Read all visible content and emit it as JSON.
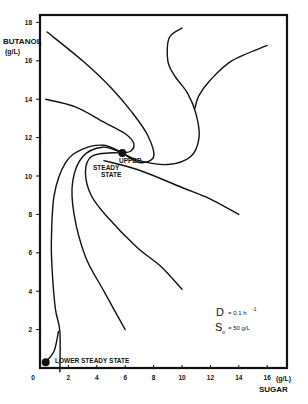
{
  "chart_data": {
    "type": "line",
    "title": "",
    "xlabel": "SUGAR",
    "xunit": "(g/L)",
    "ylabel": "BUTANOL",
    "yunit": "(g/L)",
    "xlim": [
      0,
      17.4
    ],
    "ylim": [
      0,
      18.4
    ],
    "xticks": [
      "0",
      "2",
      "4",
      "6",
      "8",
      "10",
      "12",
      "14",
      "16"
    ],
    "yticks": [
      "2",
      "4",
      "6",
      "8",
      "10",
      "12",
      "14",
      "16",
      "18"
    ],
    "grid": false,
    "annotations": {
      "upper_steady_state_line1": "UPPER",
      "upper_steady_state_line2": "STEADY",
      "upper_steady_state_line3": "STATE",
      "lower_steady_state": "LOWER STEADY STATE",
      "param_D": "D = 0.1 h",
      "param_D_exp": "-1",
      "param_S": "S",
      "param_S_sub": "o",
      "param_S_val": "= 50 g/L"
    },
    "steady_states": [
      {
        "name": "upper",
        "sugar": 5.8,
        "butanol": 11.2
      },
      {
        "name": "lower",
        "sugar": 0.4,
        "butanol": 0.3
      }
    ],
    "series": [
      {
        "name": "trajectory-1",
        "points": [
          [
            0.5,
            17.5
          ],
          [
            3.0,
            16.0
          ],
          [
            5.0,
            14.6
          ],
          [
            6.5,
            13.3
          ],
          [
            7.6,
            12.1
          ],
          [
            8.0,
            11.0
          ],
          [
            7.0,
            10.7
          ],
          [
            5.8,
            11.2
          ]
        ]
      },
      {
        "name": "trajectory-2",
        "points": [
          [
            0.4,
            14.0
          ],
          [
            2.5,
            13.6
          ],
          [
            4.5,
            12.8
          ],
          [
            6.0,
            12.2
          ],
          [
            6.6,
            11.7
          ],
          [
            6.4,
            11.3
          ],
          [
            5.8,
            11.2
          ]
        ]
      },
      {
        "name": "trajectory-3",
        "points": [
          [
            10.0,
            17.7
          ],
          [
            9.1,
            17.2
          ],
          [
            9.0,
            16.0
          ],
          [
            9.5,
            15.2
          ],
          [
            10.4,
            14.3
          ],
          [
            11.0,
            13.2
          ],
          [
            11.2,
            12.0
          ],
          [
            10.6,
            11.0
          ],
          [
            9.0,
            10.6
          ],
          [
            7.0,
            10.8
          ],
          [
            5.8,
            11.2
          ]
        ]
      },
      {
        "name": "trajectory-4",
        "points": [
          [
            16.0,
            16.8
          ],
          [
            13.5,
            16.0
          ],
          [
            12.0,
            15.0
          ],
          [
            11.2,
            14.2
          ],
          [
            10.9,
            13.5
          ]
        ]
      },
      {
        "name": "trajectory-5",
        "points": [
          [
            4.5,
            10.8
          ],
          [
            7.0,
            10.3
          ],
          [
            10.0,
            9.4
          ],
          [
            12.0,
            8.8
          ],
          [
            14.0,
            8.0
          ]
        ]
      },
      {
        "name": "trajectory-6",
        "points": [
          [
            1.4,
            -0.2
          ],
          [
            1.4,
            1.9
          ],
          [
            1.1,
            3.0
          ],
          [
            0.9,
            4.6
          ],
          [
            0.8,
            6.5
          ],
          [
            1.0,
            9.0
          ],
          [
            1.8,
            10.7
          ],
          [
            3.0,
            11.4
          ],
          [
            4.5,
            11.6
          ],
          [
            5.8,
            11.2
          ]
        ]
      },
      {
        "name": "trajectory-7",
        "points": [
          [
            6.0,
            2.0
          ],
          [
            4.5,
            4.0
          ],
          [
            3.2,
            5.8
          ],
          [
            2.4,
            8.0
          ],
          [
            2.3,
            9.7
          ],
          [
            3.0,
            11.0
          ],
          [
            4.4,
            11.5
          ],
          [
            5.8,
            11.2
          ]
        ]
      },
      {
        "name": "trajectory-8",
        "points": [
          [
            10.0,
            4.1
          ],
          [
            8.5,
            5.3
          ],
          [
            6.8,
            6.3
          ],
          [
            4.7,
            7.9
          ],
          [
            3.6,
            9.0
          ],
          [
            3.2,
            10.2
          ],
          [
            3.6,
            11.0
          ],
          [
            4.8,
            11.2
          ],
          [
            5.8,
            11.2
          ]
        ]
      },
      {
        "name": "trajectory-9",
        "points": [
          [
            0.4,
            0.3
          ],
          [
            1.0,
            0.9
          ],
          [
            1.3,
            1.9
          ]
        ]
      }
    ]
  }
}
